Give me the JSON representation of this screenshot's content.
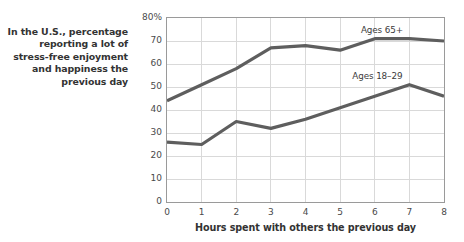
{
  "caption": "In the U.S., percentage reporting a lot of stress-free enjoyment and happiness the previous day",
  "axis": {
    "y_ticks": [
      "80%",
      "70",
      "60",
      "50",
      "40",
      "30",
      "20",
      "10",
      "0"
    ],
    "x_ticks": [
      "0",
      "1",
      "2",
      "3",
      "4",
      "5",
      "6",
      "7",
      "8"
    ],
    "xlabel": "Hours spent with others the previous day"
  },
  "series_labels": {
    "older": "Ages 65+",
    "younger": "Ages 18–29"
  },
  "colors": {
    "line": "#5e5e5e",
    "grid": "#d9d9d9",
    "frame": "#9a9a9a",
    "text": "#333333"
  },
  "chart_data": {
    "type": "line",
    "title": "In the U.S., percentage reporting a lot of stress-free enjoyment and happiness the previous day",
    "xlabel": "Hours spent with others the previous day",
    "ylabel": "",
    "x": [
      0,
      1,
      2,
      3,
      4,
      5,
      6,
      7,
      8
    ],
    "xlim": [
      0,
      8
    ],
    "ylim": [
      0,
      80
    ],
    "yticks": [
      0,
      10,
      20,
      30,
      40,
      50,
      60,
      70,
      80
    ],
    "ytick_labels": [
      "0",
      "10",
      "20",
      "30",
      "40",
      "50",
      "60",
      "70",
      "80%"
    ],
    "grid": true,
    "legend_position": "inline-annotation",
    "series": [
      {
        "name": "Ages 65+",
        "values": [
          44,
          51,
          58,
          67,
          68,
          66,
          71,
          71,
          70
        ],
        "color": "#5e5e5e"
      },
      {
        "name": "Ages 18–29",
        "values": [
          26,
          25,
          35,
          32,
          36,
          41,
          46,
          51,
          46
        ],
        "color": "#5e5e5e"
      }
    ]
  }
}
